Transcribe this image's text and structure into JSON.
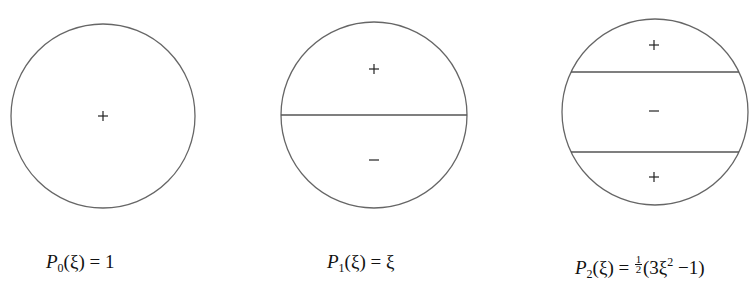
{
  "figure": {
    "stroke_color": "#666666",
    "sign_color": "#222222",
    "panels": [
      {
        "id": "P0",
        "circle": {
          "cx": 103,
          "cy": 116,
          "r": 92
        },
        "nodal_lines_y": [],
        "signs": [
          {
            "symbol": "+",
            "x": 103,
            "y": 116
          }
        ],
        "label": {
          "name": "P",
          "sub": "0",
          "arg": "(ξ)",
          "rhs": "= 1"
        }
      },
      {
        "id": "P1",
        "circle": {
          "cx": 374,
          "cy": 115,
          "r": 93
        },
        "nodal_lines_y": [
          115
        ],
        "signs": [
          {
            "symbol": "+",
            "x": 374,
            "y": 69
          },
          {
            "symbol": "−",
            "x": 374,
            "y": 160
          }
        ],
        "label": {
          "name": "P",
          "sub": "1",
          "arg": "(ξ)",
          "rhs": "= ξ"
        }
      },
      {
        "id": "P2",
        "circle": {
          "cx": 655,
          "cy": 112,
          "r": 93
        },
        "nodal_lines_y": [
          72,
          152
        ],
        "signs": [
          {
            "symbol": "+",
            "x": 654,
            "y": 45
          },
          {
            "symbol": "−",
            "x": 654,
            "y": 111
          },
          {
            "symbol": "+",
            "x": 654,
            "y": 177
          }
        ],
        "label": {
          "name": "P",
          "sub": "2",
          "arg": "(ξ)",
          "eq": "=",
          "frac_num": "1",
          "frac_den": "2",
          "paren_open": "(3",
          "xi": "ξ",
          "sup": "2",
          "tail": "−1)"
        }
      }
    ]
  }
}
